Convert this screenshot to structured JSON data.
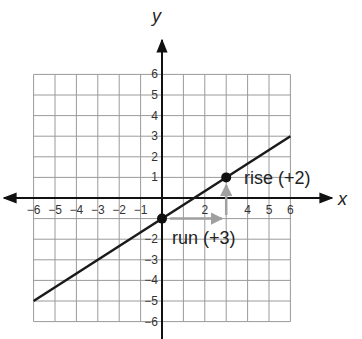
{
  "chart_data": {
    "type": "line",
    "title": "",
    "xlabel": "x",
    "ylabel": "y",
    "xlim": [
      -6,
      6
    ],
    "ylim": [
      -6,
      6
    ],
    "grid": true,
    "x_tick_labels": [
      "-6",
      "-5",
      "-4",
      "-3",
      "-2",
      "-1",
      "2",
      "4",
      "5",
      "6"
    ],
    "x_tick_values": [
      -6,
      -5,
      -4,
      -3,
      -2,
      -1,
      2,
      4,
      5,
      6
    ],
    "y_tick_labels": [
      "6",
      "5",
      "4",
      "3",
      "2",
      "1",
      "-2",
      "-3",
      "-4",
      "-5",
      "-6"
    ],
    "y_tick_values": [
      6,
      5,
      4,
      3,
      2,
      1,
      -2,
      -3,
      -4,
      -5,
      -6
    ],
    "series": [
      {
        "name": "line",
        "equation": "y = (2/3)x - 1",
        "x": [
          -6,
          6
        ],
        "y": [
          -5,
          3
        ],
        "color": "#1a1a1a"
      }
    ],
    "points": [
      {
        "x": 0,
        "y": -1
      },
      {
        "x": 3,
        "y": 1
      }
    ],
    "annotations": [
      {
        "text": "rise (+2)",
        "from": [
          3,
          -1
        ],
        "to": [
          3,
          1
        ],
        "color": "#999999"
      },
      {
        "text": "run (+3)",
        "from": [
          0,
          -1
        ],
        "to": [
          3,
          -1
        ],
        "color": "#999999"
      }
    ]
  },
  "labels": {
    "x_axis": "x",
    "y_axis": "y",
    "rise": "rise (+2)",
    "run": "run (+3)"
  },
  "colors": {
    "grid": "#9a9a9a",
    "axis": "#111111",
    "line": "#1a1a1a",
    "arrow": "#a0a0a0"
  }
}
